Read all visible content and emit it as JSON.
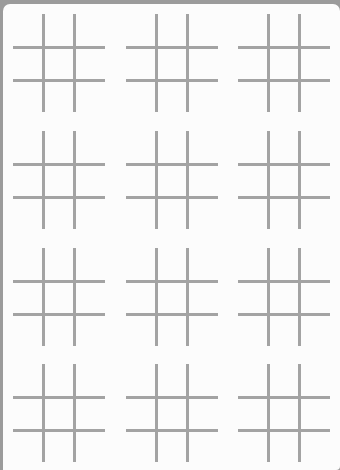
{
  "app": {
    "type": "tic-tac-toe board sheet",
    "grid_color": "#a3a3a3",
    "frame_color": "#9b9b9b",
    "panel_color": "#fcfcfc"
  },
  "boards": {
    "rows": 4,
    "columns": 3,
    "count": 12,
    "cells_per_board": 9,
    "positions": [
      {
        "x": 10,
        "y": 10
      },
      {
        "x": 123,
        "y": 10
      },
      {
        "x": 235,
        "y": 10
      },
      {
        "x": 10,
        "y": 127
      },
      {
        "x": 123,
        "y": 127
      },
      {
        "x": 235,
        "y": 127
      },
      {
        "x": 10,
        "y": 244
      },
      {
        "x": 123,
        "y": 244
      },
      {
        "x": 235,
        "y": 244
      },
      {
        "x": 10,
        "y": 360
      },
      {
        "x": 123,
        "y": 360
      },
      {
        "x": 235,
        "y": 360
      }
    ]
  }
}
